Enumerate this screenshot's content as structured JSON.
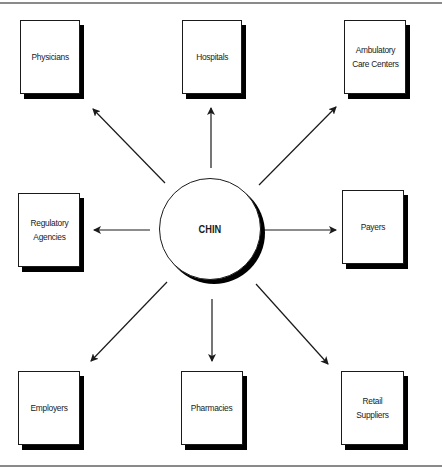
{
  "diagram": {
    "type": "hub-and-spoke",
    "center": {
      "label": "CHIN"
    },
    "nodes": [
      {
        "id": "physicians",
        "label": "Physicians",
        "position": "top-left"
      },
      {
        "id": "hospitals",
        "label": "Hospitals",
        "position": "top-center"
      },
      {
        "id": "ambulatory",
        "label": "Ambulatory\nCare Centers",
        "position": "top-right"
      },
      {
        "id": "regulatory",
        "label": "Regulatory\nAgencies",
        "position": "middle-left"
      },
      {
        "id": "payers",
        "label": "Payers",
        "position": "middle-right"
      },
      {
        "id": "employers",
        "label": "Employers",
        "position": "bottom-left"
      },
      {
        "id": "pharmacies",
        "label": "Pharmacies",
        "position": "bottom-center"
      },
      {
        "id": "retail",
        "label": "Retail\nSuppliers",
        "position": "bottom-right"
      }
    ],
    "edges": [
      {
        "from": "CHIN",
        "to": "physicians",
        "direction": "outward"
      },
      {
        "from": "CHIN",
        "to": "hospitals",
        "direction": "outward"
      },
      {
        "from": "CHIN",
        "to": "ambulatory",
        "direction": "outward"
      },
      {
        "from": "CHIN",
        "to": "regulatory",
        "direction": "outward"
      },
      {
        "from": "CHIN",
        "to": "payers",
        "direction": "outward"
      },
      {
        "from": "CHIN",
        "to": "employers",
        "direction": "outward"
      },
      {
        "from": "CHIN",
        "to": "pharmacies",
        "direction": "outward"
      },
      {
        "from": "CHIN",
        "to": "retail",
        "direction": "outward"
      }
    ],
    "colors": {
      "stroke": "#1a1a1a",
      "shadow": "#000000",
      "fill": "#ffffff",
      "frame": "#8a8a8a"
    }
  }
}
